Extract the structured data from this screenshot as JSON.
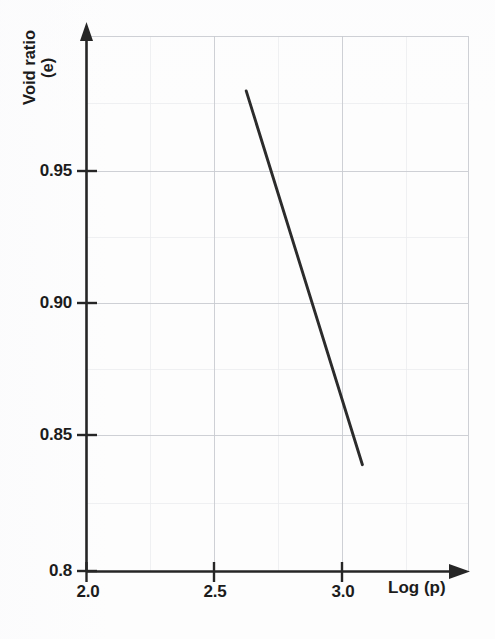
{
  "chart_data": {
    "type": "line",
    "title": "",
    "subtitle": "",
    "xlabel": "Log (p)",
    "ylabel_line1": "Void ratio",
    "ylabel_line2": "(e)",
    "ylabel": "Void ratio (e)",
    "xlim": [
      2.0,
      3.5
    ],
    "ylim": [
      0.8,
      1.0
    ],
    "xticks": [
      2.0,
      2.5,
      3.0
    ],
    "xticklabels": [
      "2.0",
      "2.5",
      "3.0"
    ],
    "yticks": [
      0.8,
      0.85,
      0.9,
      0.95
    ],
    "yticklabels": [
      "0.8",
      "0.85",
      "0.90",
      "0.95"
    ],
    "grid": true,
    "grid_color": "#c9cbd0",
    "legend": null,
    "series": [
      {
        "name": "compression line",
        "color": "#2b2b2b",
        "x": [
          2.625,
          3.08
        ],
        "y": [
          0.98,
          0.84
        ]
      }
    ],
    "annotations": []
  },
  "figure": {
    "background": "#fdfdfd",
    "axis_color": "#262626",
    "x_axis_has_arrow": true,
    "y_axis_has_arrow": true
  }
}
